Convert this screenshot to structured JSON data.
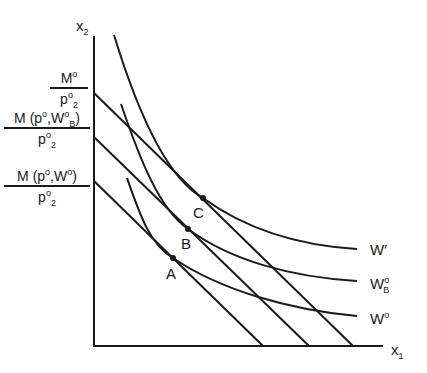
{
  "diagram": {
    "type": "indifference-curves-budget-lines",
    "axes": {
      "x_label": "x",
      "x_sub": "1",
      "y_label": "x",
      "y_sub": "2"
    },
    "y_intercept_labels": [
      {
        "num_main": "M",
        "num_sup": "o",
        "den_main": "p",
        "den_sup": "o",
        "den_sub": "2"
      },
      {
        "num_main": "M (p",
        "num_sup": "o",
        "num_mid": ",W",
        "num_sup2": "o",
        "num_sub2": "B",
        "num_end": ")",
        "den_main": "p",
        "den_sup": "o",
        "den_sub": "2"
      },
      {
        "num_main": "M (p",
        "num_sup": "o",
        "num_mid": ",W",
        "num_sup2": "o",
        "num_end": ")",
        "den_main": "p",
        "den_sup": "o",
        "den_sub": "2"
      }
    ],
    "curves": [
      {
        "name": "W′",
        "label_main": "W",
        "label_sup": "′"
      },
      {
        "name": "W_B^o",
        "label_main": "W",
        "label_sup": "o",
        "label_sub": "B"
      },
      {
        "name": "W^o",
        "label_main": "W",
        "label_sup": "o"
      }
    ],
    "points": [
      {
        "label": "C"
      },
      {
        "label": "B"
      },
      {
        "label": "A"
      }
    ],
    "colors": {
      "ink": "#1a1a1a",
      "background": "#ffffff"
    }
  }
}
